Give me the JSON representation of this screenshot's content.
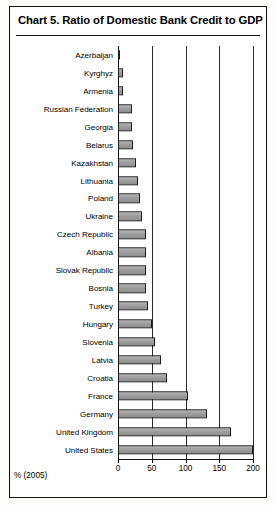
{
  "chart": {
    "title": "Chart 5.  Ratio of Domestic Bank Credit to GDP"
  },
  "chart_data": {
    "type": "bar",
    "orientation": "horizontal",
    "title": "Chart 5.  Ratio of Domestic Bank Credit to GDP",
    "xlabel": "% (2005)",
    "ylabel": "",
    "xlim": [
      0,
      200
    ],
    "xticks": [
      0,
      50,
      100,
      150,
      200
    ],
    "xtick_labels": [
      "0",
      "50",
      "100",
      "150",
      "200"
    ],
    "grid": "vertical",
    "legend": "none",
    "bar_fill": "#9e9e9e",
    "bar_edge": "#1c1c1c",
    "categories": [
      "Azerbaijan",
      "Kyrghyz",
      "Armenia",
      "Russian Federation",
      "Georgia",
      "Belarus",
      "Kazakhstan",
      "Lithuania",
      "Poland",
      "Ukraine",
      "Czech Republic",
      "Albania",
      "Slovak Republic",
      "Bosnia",
      "Turkey",
      "Hungary",
      "Slovenia",
      "Latvia",
      "Croatia",
      "France",
      "Germany",
      "United Kingdom",
      "United States"
    ],
    "values": [
      2,
      8,
      8,
      20,
      20,
      22,
      27,
      30,
      32,
      35,
      42,
      42,
      42,
      42,
      45,
      50,
      55,
      63,
      72,
      103,
      132,
      167,
      200
    ]
  }
}
